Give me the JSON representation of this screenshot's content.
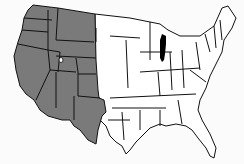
{
  "map": {
    "title": "",
    "region": "Contiguous United States",
    "colors": {
      "shaded": "#7a7a7a",
      "unshaded": "#ffffff",
      "border": "#111111",
      "water_highlight": "#000000",
      "background": "#fbfbfb"
    },
    "shaded_states": [
      "Washington",
      "Oregon",
      "California",
      "Idaho",
      "Nevada",
      "Utah",
      "Arizona",
      "Montana",
      "Wyoming",
      "Colorado",
      "New Mexico",
      "North Dakota",
      "South Dakota",
      "Nebraska",
      "Kansas",
      "Oklahoma",
      "Texas (western portion)"
    ],
    "highlighted_feature": "Lake Michigan",
    "marker": "Great Salt Lake (white spot in Utah)"
  }
}
